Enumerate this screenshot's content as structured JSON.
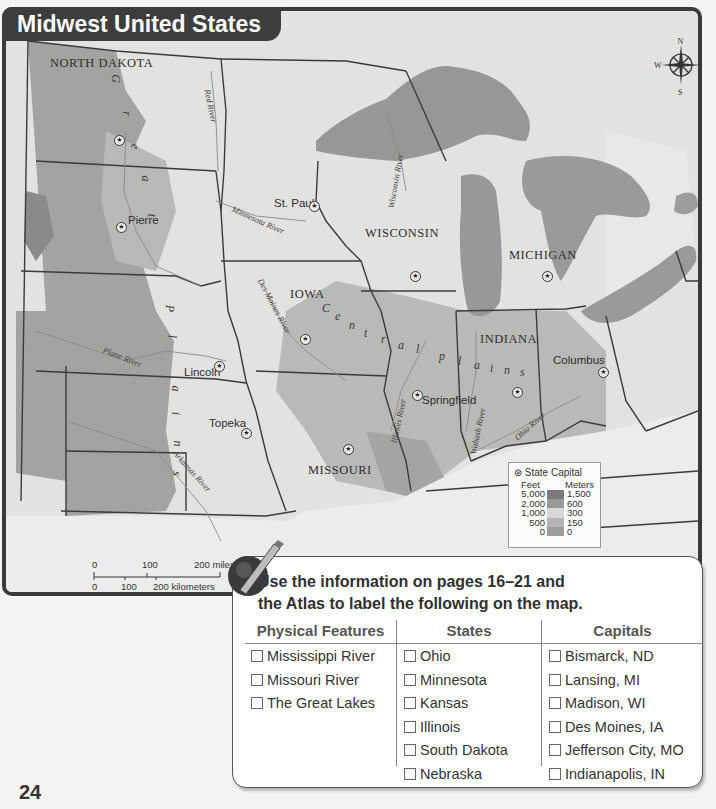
{
  "map": {
    "title": "Midwest United States",
    "states": [
      {
        "name": "NORTH DAKOTA",
        "x": 46,
        "y": 50
      },
      {
        "name": "IOWA",
        "x": 286,
        "y": 282
      },
      {
        "name": "WISCONSIN",
        "x": 361,
        "y": 221
      },
      {
        "name": "MICHIGAN",
        "x": 505,
        "y": 243
      },
      {
        "name": "INDIANA",
        "x": 476,
        "y": 327
      },
      {
        "name": "MISSOURI",
        "x": 304,
        "y": 458
      }
    ],
    "capitals": [
      {
        "name": "St. Paul",
        "x": 270,
        "y": 193,
        "sx": 307,
        "sy": 197
      },
      {
        "name": "Pierre",
        "x": 124,
        "y": 210,
        "sx": 114,
        "sy": 218
      },
      {
        "name": "Lincoln",
        "x": 180,
        "y": 362,
        "sx": 212,
        "sy": 357
      },
      {
        "name": "Topeka",
        "x": 205,
        "y": 413,
        "sx": 239,
        "sy": 424
      },
      {
        "name": "Springfield",
        "x": 418,
        "y": 390,
        "sx": 410,
        "sy": 386
      },
      {
        "name": "Columbus",
        "x": 549,
        "y": 350,
        "sx": 596,
        "sy": 363
      },
      {
        "name": "",
        "x": 0,
        "y": 0,
        "sx": 112,
        "sy": 131
      },
      {
        "name": "",
        "x": 0,
        "y": 0,
        "sx": 408,
        "sy": 267
      },
      {
        "name": "",
        "x": 0,
        "y": 0,
        "sx": 540,
        "sy": 267
      },
      {
        "name": "",
        "x": 0,
        "y": 0,
        "sx": 298,
        "sy": 330
      },
      {
        "name": "",
        "x": 0,
        "y": 0,
        "sx": 341,
        "sy": 440
      },
      {
        "name": "",
        "x": 0,
        "y": 0,
        "sx": 510,
        "sy": 383
      }
    ],
    "rivers": [
      {
        "name": "Red River",
        "x": 200,
        "y": 90,
        "rot": 78
      },
      {
        "name": "Minnesota River",
        "x": 225,
        "y": 213,
        "rot": 24
      },
      {
        "name": "Wisconsin River",
        "x": 381,
        "y": 168,
        "rot": -80
      },
      {
        "name": "Des Moines River",
        "x": 248,
        "y": 295,
        "rot": 62
      },
      {
        "name": "Platte River",
        "x": 100,
        "y": 348,
        "rot": 22
      },
      {
        "name": "Arkansas River",
        "x": 163,
        "y": 460,
        "rot": 48
      },
      {
        "name": "Illinois River",
        "x": 384,
        "y": 410,
        "rot": -78
      },
      {
        "name": "Wabash River",
        "x": 462,
        "y": 420,
        "rot": -78
      },
      {
        "name": "Ohio River",
        "x": 515,
        "y": 420,
        "rot": -42
      }
    ],
    "regions": {
      "great_plains_letters": [
        "G",
        "r",
        "e",
        "a",
        "t",
        "P",
        "l",
        "a",
        "i",
        "n",
        "s"
      ],
      "central_plains_letters": [
        "C",
        "e",
        "n",
        "t",
        "r",
        "a",
        "l",
        "p",
        "l",
        "a",
        "i",
        "n",
        "s"
      ]
    },
    "compass": {
      "n": "N",
      "s": "S",
      "e": "E",
      "w": "W"
    },
    "legend": {
      "state_capital": "State Capital",
      "feet_label": "Feet",
      "meters_label": "Meters",
      "feet_values": [
        "5,000",
        "2,000",
        "1,000",
        "500",
        "0"
      ],
      "meters_values": [
        "1,500",
        "600",
        "300",
        "150",
        "0"
      ],
      "ramp_colors": [
        "#7a7a7a",
        "#9a9a9a",
        "#d8d8d8",
        "#b4b4b4",
        "#9c9c9c"
      ]
    },
    "scale": {
      "miles": [
        "0",
        "100",
        "200 miles"
      ],
      "km": [
        "0",
        "100",
        "200 kilometers"
      ]
    }
  },
  "activity": {
    "instruction_line1": "Use the information on pages 16–21 and",
    "instruction_line2": "the Atlas to label the following on the map.",
    "columns": [
      {
        "header": "Physical Features",
        "items": [
          "Mississippi River",
          "Missouri River",
          "The Great Lakes"
        ]
      },
      {
        "header": "States",
        "items": [
          "Ohio",
          "Minnesota",
          "Kansas",
          "Illinois",
          "South Dakota",
          "Nebraska"
        ]
      },
      {
        "header": "Capitals",
        "items": [
          "Bismarck, ND",
          "Lansing, MI",
          "Madison, WI",
          "Des Moines, IA",
          "Jefferson City, MO",
          "Indianapolis, IN"
        ]
      }
    ]
  },
  "page_number": "24"
}
